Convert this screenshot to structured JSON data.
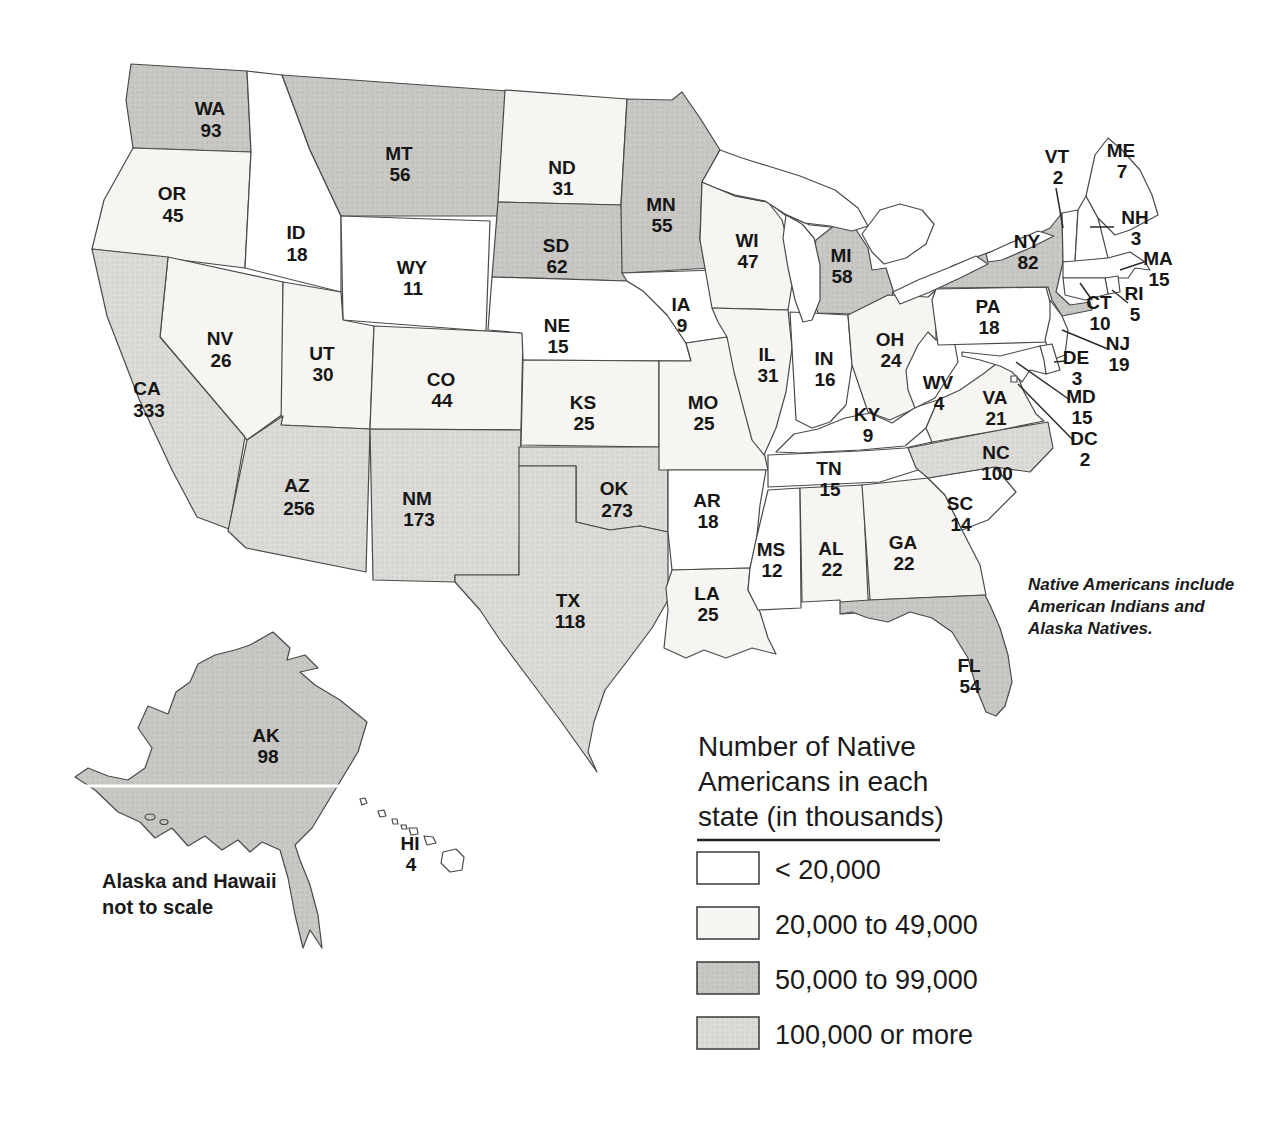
{
  "map_title": "Number of Native Americans in each state (in thousands)",
  "legend": {
    "title_lines": [
      "Number of Native",
      "Americans in each",
      "state (in thousands)"
    ],
    "items": [
      {
        "label": "< 20,000",
        "category": "cat1"
      },
      {
        "label": "20,000 to 49,000",
        "category": "cat2"
      },
      {
        "label": "50,000 to 99,000",
        "category": "cat3"
      },
      {
        "label": "100,000 or more",
        "category": "cat4"
      }
    ]
  },
  "colors": {
    "cat1": "#ffffff",
    "cat2": "#f6f5f1",
    "cat3": "#c9c8c5",
    "cat4": "#dcdbd7",
    "outline": "#4a4a4a",
    "text": "#161616"
  },
  "notes": {
    "inclusion_lines": [
      "Native Americans include",
      "American Indians and",
      "Alaska Natives."
    ],
    "scale_lines": [
      "Alaska and Hawaii",
      "not to scale"
    ]
  },
  "states": {
    "WA": {
      "abbr": "WA",
      "value": "93",
      "category": "cat3"
    },
    "OR": {
      "abbr": "OR",
      "value": "45",
      "category": "cat2"
    },
    "CA": {
      "abbr": "CA",
      "value": "333",
      "category": "cat4"
    },
    "ID": {
      "abbr": "ID",
      "value": "18",
      "category": "cat1"
    },
    "NV": {
      "abbr": "NV",
      "value": "26",
      "category": "cat2"
    },
    "UT": {
      "abbr": "UT",
      "value": "30",
      "category": "cat2"
    },
    "AZ": {
      "abbr": "AZ",
      "value": "256",
      "category": "cat4"
    },
    "MT": {
      "abbr": "MT",
      "value": "56",
      "category": "cat3"
    },
    "WY": {
      "abbr": "WY",
      "value": "11",
      "category": "cat1"
    },
    "CO": {
      "abbr": "CO",
      "value": "44",
      "category": "cat2"
    },
    "NM": {
      "abbr": "NM",
      "value": "173",
      "category": "cat4"
    },
    "ND": {
      "abbr": "ND",
      "value": "31",
      "category": "cat2"
    },
    "SD": {
      "abbr": "SD",
      "value": "62",
      "category": "cat3"
    },
    "NE": {
      "abbr": "NE",
      "value": "15",
      "category": "cat1"
    },
    "KS": {
      "abbr": "KS",
      "value": "25",
      "category": "cat2"
    },
    "OK": {
      "abbr": "OK",
      "value": "273",
      "category": "cat4"
    },
    "TX": {
      "abbr": "TX",
      "value": "118",
      "category": "cat4"
    },
    "MN": {
      "abbr": "MN",
      "value": "55",
      "category": "cat3"
    },
    "IA": {
      "abbr": "IA",
      "value": "9",
      "category": "cat1"
    },
    "MO": {
      "abbr": "MO",
      "value": "25",
      "category": "cat2"
    },
    "AR": {
      "abbr": "AR",
      "value": "18",
      "category": "cat1"
    },
    "LA": {
      "abbr": "LA",
      "value": "25",
      "category": "cat2"
    },
    "WI": {
      "abbr": "WI",
      "value": "47",
      "category": "cat2"
    },
    "IL": {
      "abbr": "IL",
      "value": "31",
      "category": "cat2"
    },
    "MI": {
      "abbr": "MI",
      "value": "58",
      "category": "cat3"
    },
    "IN": {
      "abbr": "IN",
      "value": "16",
      "category": "cat1"
    },
    "OH": {
      "abbr": "OH",
      "value": "24",
      "category": "cat2"
    },
    "KY": {
      "abbr": "KY",
      "value": "9",
      "category": "cat1"
    },
    "TN": {
      "abbr": "TN",
      "value": "15",
      "category": "cat1"
    },
    "MS": {
      "abbr": "MS",
      "value": "12",
      "category": "cat1"
    },
    "AL": {
      "abbr": "AL",
      "value": "22",
      "category": "cat2"
    },
    "GA": {
      "abbr": "GA",
      "value": "22",
      "category": "cat2"
    },
    "FL": {
      "abbr": "FL",
      "value": "54",
      "category": "cat3"
    },
    "SC": {
      "abbr": "SC",
      "value": "14",
      "category": "cat1"
    },
    "NC": {
      "abbr": "NC",
      "value": "100",
      "category": "cat4"
    },
    "VA": {
      "abbr": "VA",
      "value": "21",
      "category": "cat2"
    },
    "WV": {
      "abbr": "WV",
      "value": "4",
      "category": "cat1"
    },
    "PA": {
      "abbr": "PA",
      "value": "18",
      "category": "cat1"
    },
    "NY": {
      "abbr": "NY",
      "value": "82",
      "category": "cat3"
    },
    "NJ": {
      "abbr": "NJ",
      "value": "19",
      "category": "cat1"
    },
    "CT": {
      "abbr": "CT",
      "value": "10",
      "category": "cat1"
    },
    "RI": {
      "abbr": "RI",
      "value": "5",
      "category": "cat1"
    },
    "MA": {
      "abbr": "MA",
      "value": "15",
      "category": "cat1"
    },
    "VT": {
      "abbr": "VT",
      "value": "2",
      "category": "cat1"
    },
    "NH": {
      "abbr": "NH",
      "value": "3",
      "category": "cat1"
    },
    "ME": {
      "abbr": "ME",
      "value": "7",
      "category": "cat1"
    },
    "DE": {
      "abbr": "DE",
      "value": "3",
      "category": "cat1"
    },
    "MD": {
      "abbr": "MD",
      "value": "15",
      "category": "cat1"
    },
    "DC": {
      "abbr": "DC",
      "value": "2",
      "category": "cat1"
    },
    "AK": {
      "abbr": "AK",
      "value": "98",
      "category": "cat3"
    },
    "HI": {
      "abbr": "HI",
      "value": "4",
      "category": "cat1"
    }
  }
}
